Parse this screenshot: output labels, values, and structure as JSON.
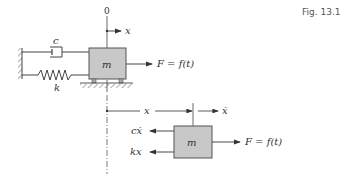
{
  "figure": {
    "label": "Fig. 13.1"
  },
  "system": {
    "origin_label": "0",
    "position_label": "x",
    "damper_label": "c",
    "spring_label": "k",
    "mass_label": "m",
    "force_label": "F = f(t)"
  },
  "free_body": {
    "displacement_label": "x",
    "velocity_label": "ẋ",
    "damping_force_label": "cẋ",
    "spring_force_label": "kx",
    "mass_label": "m",
    "force_label": "F = f(t)"
  },
  "colors": {
    "mass_fill": "#c8c8c8",
    "line": "#444444",
    "hatch": "#888888"
  }
}
